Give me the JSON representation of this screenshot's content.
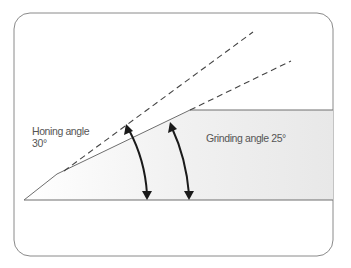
{
  "diagram": {
    "labels": {
      "honing_line1": "Honing angle",
      "honing_line2": "30°",
      "grinding": "Grinding angle 25°"
    },
    "colors": {
      "frame": "#8a8a8a",
      "outline": "#6e6e6e",
      "fill": "#ececec",
      "arrow": "#1a1a1a",
      "text": "#555555"
    },
    "angles": {
      "honing_deg": 30,
      "grinding_deg": 25
    }
  }
}
